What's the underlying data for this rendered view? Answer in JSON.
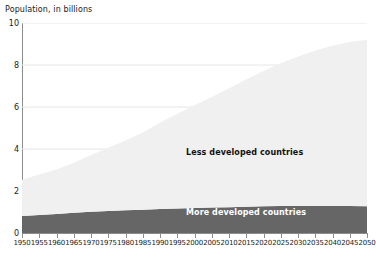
{
  "chart_data": {
    "type": "area",
    "stacked": true,
    "title": "Population, in billions",
    "xlabel": "",
    "ylabel": "Population, in billions",
    "ylim": [
      0,
      10
    ],
    "yticks": [
      0,
      2,
      4,
      6,
      8,
      10
    ],
    "ytick_labels": [
      "0",
      "2",
      "4",
      "6",
      "8",
      "10"
    ],
    "grid": true,
    "grid_axis": "y",
    "legend_position": "inline-annotation",
    "categories": [
      1950,
      1955,
      1960,
      1965,
      1970,
      1975,
      1980,
      1985,
      1990,
      1995,
      2000,
      2005,
      2010,
      2015,
      2020,
      2025,
      2030,
      2035,
      2040,
      2045,
      2050
    ],
    "xtick_labels": [
      "1950",
      "1955",
      "1960",
      "1965",
      "1970",
      "1975",
      "1980",
      "1985",
      "1990",
      "1995",
      "2000",
      "2005",
      "2010",
      "2015",
      "2020",
      "2025",
      "2030",
      "2035",
      "2040",
      "2045",
      "2050"
    ],
    "series": [
      {
        "name": "More developed countries",
        "color": "#666666",
        "label_color": "#ffffff",
        "values": [
          0.81,
          0.86,
          0.91,
          0.96,
          1.01,
          1.05,
          1.08,
          1.11,
          1.14,
          1.17,
          1.19,
          1.21,
          1.23,
          1.25,
          1.27,
          1.28,
          1.29,
          1.29,
          1.29,
          1.28,
          1.27
        ]
      },
      {
        "name": "Less developed countries",
        "color": "#f0f0f0",
        "label_color": "#111111",
        "values": [
          1.72,
          1.92,
          2.11,
          2.39,
          2.7,
          3.01,
          3.33,
          3.68,
          4.11,
          4.51,
          4.89,
          5.27,
          5.66,
          6.06,
          6.44,
          6.8,
          7.12,
          7.4,
          7.63,
          7.81,
          7.93
        ]
      }
    ],
    "totals": [
      2.53,
      2.78,
      3.02,
      3.35,
      3.71,
      4.06,
      4.41,
      4.79,
      5.25,
      5.68,
      6.08,
      6.48,
      6.89,
      7.31,
      7.71,
      8.08,
      8.41,
      8.69,
      8.92,
      9.09,
      9.2
    ],
    "annotations": [
      {
        "text": "Less developed countries",
        "series": "Less developed countries"
      },
      {
        "text": "More developed countries",
        "series": "More developed countries"
      }
    ],
    "colors": {
      "less_developed": "#f0f0f0",
      "more_developed": "#666666",
      "axis": "#8d8d8d",
      "grid": "#e6e6e6",
      "text": "#1a1a1a",
      "background": "#ffffff"
    }
  }
}
